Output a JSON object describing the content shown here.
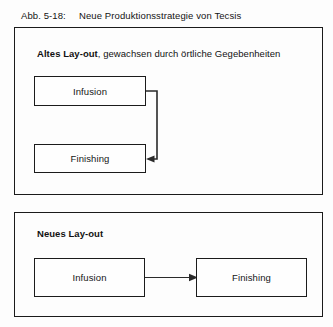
{
  "figure": {
    "caption_number": "Abb. 5-18:",
    "caption_text": "Neue Produktionsstrategie von Tecsis"
  },
  "panels": [
    {
      "id": "old",
      "title_bold": "Altes Lay-out",
      "title_rest": ", gewachsen durch örtliche Gegebenheiten",
      "boxes": [
        {
          "label": "Infusion"
        },
        {
          "label": "Finishing"
        }
      ],
      "connector": {
        "name": "infusion-to-finishing-routed-arrow",
        "from": "Infusion",
        "to": "Finishing",
        "style": "orthogonal-right-down-left",
        "arrowhead": "left"
      }
    },
    {
      "id": "new",
      "title_bold": "Neues Lay-out",
      "title_rest": "",
      "boxes": [
        {
          "label": "Infusion"
        },
        {
          "label": "Finishing"
        }
      ],
      "connector": {
        "name": "infusion-to-finishing-straight-arrow",
        "from": "Infusion",
        "to": "Finishing",
        "style": "straight-horizontal",
        "arrowhead": "right"
      }
    }
  ],
  "colors": {
    "background": "#fdfdfd",
    "stroke": "#1b1b1b",
    "text": "#151515"
  }
}
